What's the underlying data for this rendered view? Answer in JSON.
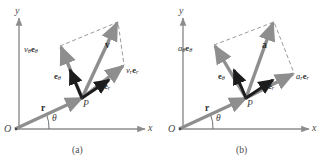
{
  "figure": {
    "type": "vector-decomposition-diagram",
    "panels": [
      {
        "id": "a",
        "caption": "(a)",
        "axes": {
          "x_label": "x",
          "y_label": "y",
          "origin_label": "O"
        },
        "point_label": "P",
        "angle_label": "θ",
        "position_vector_label": "r",
        "main_vector_label": "v",
        "unit_vectors": [
          {
            "name": "e-theta",
            "label_html": "<b>e</b><span class=\"sub\">θ</span>"
          },
          {
            "name": "e-r",
            "label_html": "<b>e</b><span class=\"sub\">r</span>"
          }
        ],
        "components": [
          {
            "name": "v-theta-component",
            "label_html": "<i>v</i><span class=\"sub\">θ</span><b>e</b><span class=\"sub\">θ</span>"
          },
          {
            "name": "v-r-component",
            "label_html": "<i>v</i><span class=\"sub\">r</span><b>e</b><span class=\"sub\">r</span>"
          }
        ]
      },
      {
        "id": "b",
        "caption": "(b)",
        "axes": {
          "x_label": "x",
          "y_label": "y",
          "origin_label": "O"
        },
        "point_label": "P",
        "angle_label": "θ",
        "position_vector_label": "r",
        "main_vector_label": "a",
        "unit_vectors": [
          {
            "name": "e-theta",
            "label_html": "<b>e</b><span class=\"sub\">θ</span>"
          },
          {
            "name": "e-r",
            "label_html": "<b>e</b><span class=\"sub\">r</span>"
          }
        ],
        "components": [
          {
            "name": "a-theta-component",
            "label_html": "<i>a</i><span class=\"sub\">θ</span><b>e</b><span class=\"sub\">θ</span>"
          },
          {
            "name": "a-r-component",
            "label_html": "<i>a</i><span class=\"sub\">r</span><b>e</b><span class=\"sub\">r</span>"
          }
        ]
      }
    ],
    "colors": {
      "axis": "#8c8c8c",
      "gray_vector": "#8e8e8e",
      "dark_vector": "#5f5f5f",
      "black_vector": "#1c1c1c",
      "dashed": "#9a9a9a",
      "text": "#3a3a3a",
      "background": "#ffffff"
    },
    "geometry": {
      "panel_a": {
        "origin": [
          15,
          129
        ],
        "point_P": [
          82,
          98
        ],
        "v_tip": [
          118,
          22
        ],
        "v_theta_tip": [
          60,
          46
        ],
        "v_r_tip": [
          124,
          65
        ],
        "e_theta_tip": [
          68,
          69
        ],
        "e_r_tip": [
          110,
          79
        ],
        "x_axis_end": [
          145,
          129
        ],
        "y_axis_top": [
          19,
          18
        ]
      },
      "panel_b": {
        "origin": [
          15,
          129
        ],
        "point_P": [
          82,
          98
        ],
        "a_tip": [
          110,
          22
        ],
        "a_theta_tip": [
          50,
          45
        ],
        "a_r_tip": [
          130,
          72
        ],
        "e_theta_tip": [
          68,
          69
        ],
        "e_r_tip": [
          110,
          79
        ],
        "x_axis_end": [
          145,
          129
        ],
        "y_axis_top": [
          19,
          18
        ]
      }
    }
  }
}
